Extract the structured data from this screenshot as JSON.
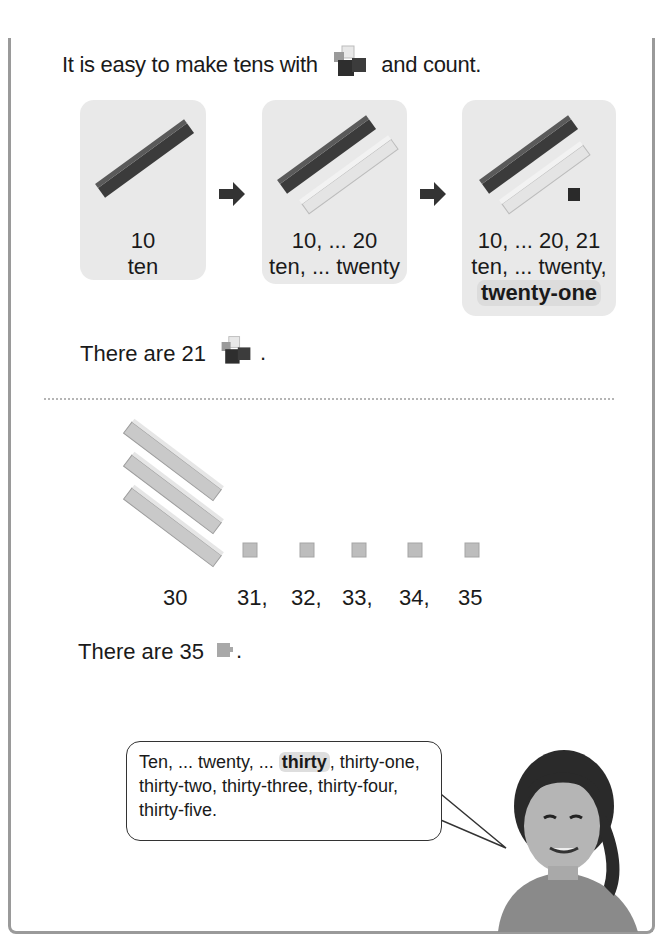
{
  "intro": {
    "before": "It is easy to make tens with",
    "cube_icon": "linking-cubes-icon",
    "after": "and count."
  },
  "cards": [
    {
      "line1": "10",
      "line2": "ten",
      "rods": [
        "dark"
      ],
      "singles": 0
    },
    {
      "line1": "10, ... 20",
      "line2": "ten, ... twenty",
      "rods": [
        "dark",
        "light"
      ],
      "singles": 0
    },
    {
      "line1": "10, ... 20, 21",
      "line2": "ten, ... twenty,",
      "line3": "twenty-one",
      "rods": [
        "dark",
        "light"
      ],
      "singles": 1
    }
  ],
  "arrow_icon": "right-arrow-icon",
  "statement1": {
    "text": "There are 21",
    "icon": "linking-cubes-icon",
    "end": "."
  },
  "counting": {
    "tens_rods": 3,
    "single_cubes": 5,
    "labels": [
      "30",
      "31,",
      "32,",
      "33,",
      "34,",
      "35"
    ]
  },
  "statement2": {
    "text": "There are 35",
    "icon": "single-cube-icon",
    "end": "."
  },
  "speech": {
    "part1": "Ten, ... twenty, ...",
    "highlight": "thirty",
    "part2": ", thirty-one, thirty-two, thirty-three, thirty-four, thirty-five."
  },
  "colors": {
    "card_bg": "#e9e9e9",
    "dark_cube": "#3a3a3a",
    "light_cube": "#e0e0e0",
    "frame": "#9a9a9a"
  }
}
